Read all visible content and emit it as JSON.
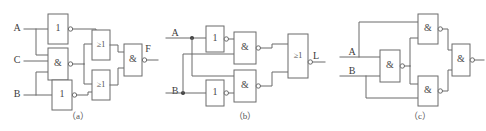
{
  "figure": {
    "background": "#ffffff",
    "line_color": "#6b6b6b",
    "text_color": "#3c3c3c"
  },
  "captions": {
    "a": "（a）",
    "b": "（b）",
    "c": "（c）"
  },
  "gate_symbols": {
    "not": "1",
    "and": "&",
    "or": "≥1"
  },
  "circuit_a": {
    "name": "circuit-a",
    "inputs": [
      "A",
      "C",
      "B"
    ],
    "output": "F",
    "gates": [
      {
        "id": "a-not-1",
        "type": "not",
        "symbol": "1",
        "inverted": true
      },
      {
        "id": "a-nand-1",
        "type": "and",
        "symbol": "&",
        "inverted": true
      },
      {
        "id": "a-not-2",
        "type": "not",
        "symbol": "1",
        "inverted": true
      },
      {
        "id": "a-or-1",
        "type": "or",
        "symbol": "≥1",
        "inverted": false
      },
      {
        "id": "a-or-2",
        "type": "or",
        "symbol": "≥1",
        "inverted": false
      },
      {
        "id": "a-nand-out",
        "type": "and",
        "symbol": "&",
        "inverted": true
      }
    ]
  },
  "circuit_b": {
    "name": "circuit-b",
    "inputs": [
      "A",
      "B"
    ],
    "output": "L",
    "gates": [
      {
        "id": "b-not-1",
        "type": "not",
        "symbol": "1",
        "inverted": true
      },
      {
        "id": "b-not-2",
        "type": "not",
        "symbol": "1",
        "inverted": true
      },
      {
        "id": "b-nand-1",
        "type": "and",
        "symbol": "&",
        "inverted": true
      },
      {
        "id": "b-nand-2",
        "type": "and",
        "symbol": "&",
        "inverted": true
      },
      {
        "id": "b-or-out",
        "type": "or",
        "symbol": "≥1",
        "inverted": true
      }
    ]
  },
  "circuit_c": {
    "name": "circuit-c",
    "inputs": [
      "A",
      "B"
    ],
    "output": "F",
    "gates": [
      {
        "id": "c-nand-1",
        "type": "and",
        "symbol": "&",
        "inverted": true
      },
      {
        "id": "c-nand-2",
        "type": "and",
        "symbol": "&",
        "inverted": true
      },
      {
        "id": "c-nand-3",
        "type": "and",
        "symbol": "&",
        "inverted": true
      },
      {
        "id": "c-nand-out",
        "type": "and",
        "symbol": "&",
        "inverted": true
      }
    ]
  }
}
